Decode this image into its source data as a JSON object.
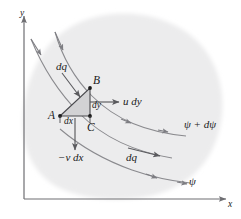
{
  "figure": {
    "kind": "stream-function-diagram",
    "background_color": "#ffffff",
    "blob_fill": "#ececed",
    "triangle_fill": "#d2d2d4",
    "line_color": "#8a8a8e",
    "axis_color": "#6e6e72",
    "text_color": "#1a1a1a"
  },
  "axes": {
    "x_label": "x",
    "y_label": "y"
  },
  "vertices": {
    "a": "A",
    "b": "B",
    "c": "C"
  },
  "edges": {
    "dx": "dx",
    "dy": "dy"
  },
  "flux_labels": {
    "dq_upper": "dq",
    "dq_lower": "dq",
    "u_dy": "u dy",
    "minus_v_dx": "−v dx"
  },
  "streamlines": {
    "upper": "ψ + dψ",
    "lower": "ψ"
  }
}
